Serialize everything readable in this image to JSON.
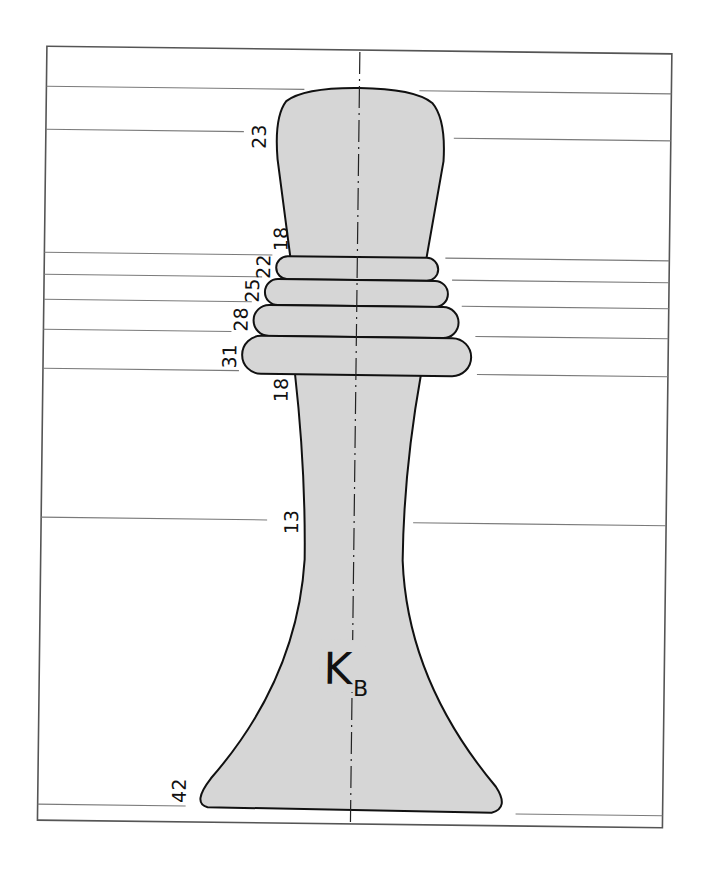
{
  "figure": {
    "label": "K",
    "label_subscript": "B",
    "fill_color": "#d6d6d6",
    "outline_color": "#111111",
    "dimensions": {
      "top_body": "23",
      "neck_top": "18",
      "ring_1": "22",
      "ring_2": "25",
      "ring_3": "28",
      "ring_4": "31",
      "stem_top": "18",
      "stem_waist": "13",
      "base": "42"
    }
  }
}
